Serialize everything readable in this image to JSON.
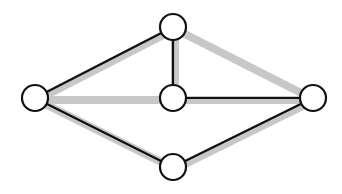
{
  "diagram": {
    "type": "graph",
    "colors": {
      "highlight": "#c8c8c8",
      "line": "#111111",
      "node_fill": "#ffffff",
      "node_stroke": "#111111"
    },
    "nodes": [
      {
        "id": "top",
        "label": ""
      },
      {
        "id": "left",
        "label": ""
      },
      {
        "id": "center",
        "label": ""
      },
      {
        "id": "right",
        "label": ""
      },
      {
        "id": "bottom",
        "label": ""
      }
    ],
    "edges": [
      {
        "from": "top",
        "to": "left",
        "highlighted": true,
        "solid": true
      },
      {
        "from": "top",
        "to": "center",
        "highlighted": true,
        "solid": true
      },
      {
        "from": "top",
        "to": "right",
        "highlighted": true,
        "solid": false
      },
      {
        "from": "left",
        "to": "center",
        "highlighted": true,
        "solid": false
      },
      {
        "from": "center",
        "to": "right",
        "highlighted": true,
        "solid": true
      },
      {
        "from": "left",
        "to": "bottom",
        "highlighted": true,
        "solid": true
      },
      {
        "from": "bottom",
        "to": "right",
        "highlighted": true,
        "solid": true
      }
    ]
  }
}
